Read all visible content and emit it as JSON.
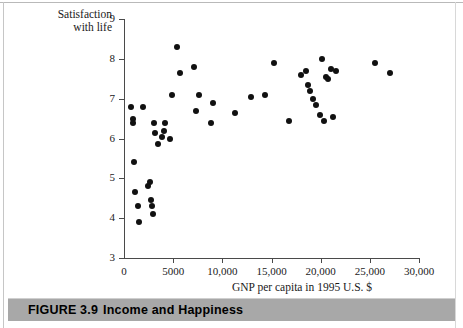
{
  "figure": {
    "caption_number": "FIGURE 3.9",
    "caption_title": "Income and Happiness"
  },
  "chart_data": {
    "type": "scatter",
    "title": "",
    "xlabel": "GNP per capita in 1995 U.S. $",
    "ylabel": "Satisfaction with life",
    "ylabel_line1": "Satisfaction",
    "ylabel_line2": "with life",
    "xlim": [
      0,
      30000
    ],
    "ylim": [
      3,
      9
    ],
    "xticks": [
      0,
      5000,
      10000,
      15000,
      20000,
      25000,
      30000
    ],
    "xtick_labels": [
      "0",
      "5000",
      "10,000",
      "15,000",
      "20,000",
      "25,000",
      "30,000"
    ],
    "yticks": [
      3,
      4,
      5,
      6,
      7,
      8,
      9
    ],
    "ytick_labels": [
      "3",
      "4",
      "5",
      "6",
      "7",
      "8",
      "9"
    ],
    "grid": false,
    "legend": false,
    "marker": "filled-circle",
    "marker_color": "#111111",
    "points": [
      {
        "x": 700,
        "y": 6.8
      },
      {
        "x": 900,
        "y": 6.5
      },
      {
        "x": 950,
        "y": 6.4
      },
      {
        "x": 1000,
        "y": 5.4
      },
      {
        "x": 1150,
        "y": 4.65
      },
      {
        "x": 1400,
        "y": 4.3
      },
      {
        "x": 1500,
        "y": 3.9
      },
      {
        "x": 1900,
        "y": 6.8
      },
      {
        "x": 2400,
        "y": 4.8
      },
      {
        "x": 2600,
        "y": 4.9
      },
      {
        "x": 2750,
        "y": 4.45
      },
      {
        "x": 2800,
        "y": 4.3
      },
      {
        "x": 2900,
        "y": 4.1
      },
      {
        "x": 3100,
        "y": 6.4
      },
      {
        "x": 3200,
        "y": 6.15
      },
      {
        "x": 3500,
        "y": 5.85
      },
      {
        "x": 3900,
        "y": 6.05
      },
      {
        "x": 4100,
        "y": 6.2
      },
      {
        "x": 4200,
        "y": 6.4
      },
      {
        "x": 4700,
        "y": 6.0
      },
      {
        "x": 4900,
        "y": 7.1
      },
      {
        "x": 5400,
        "y": 8.3
      },
      {
        "x": 5700,
        "y": 7.65
      },
      {
        "x": 7100,
        "y": 7.8
      },
      {
        "x": 7300,
        "y": 6.7
      },
      {
        "x": 7600,
        "y": 7.1
      },
      {
        "x": 8800,
        "y": 6.4
      },
      {
        "x": 9000,
        "y": 6.9
      },
      {
        "x": 11300,
        "y": 6.65
      },
      {
        "x": 12900,
        "y": 7.05
      },
      {
        "x": 14300,
        "y": 7.1
      },
      {
        "x": 15300,
        "y": 7.9
      },
      {
        "x": 16800,
        "y": 6.45
      },
      {
        "x": 18000,
        "y": 7.6
      },
      {
        "x": 18500,
        "y": 7.7
      },
      {
        "x": 18700,
        "y": 7.35
      },
      {
        "x": 18900,
        "y": 7.2
      },
      {
        "x": 19200,
        "y": 7.0
      },
      {
        "x": 19500,
        "y": 6.85
      },
      {
        "x": 19900,
        "y": 6.6
      },
      {
        "x": 20100,
        "y": 8.0
      },
      {
        "x": 20300,
        "y": 6.45
      },
      {
        "x": 20500,
        "y": 7.55
      },
      {
        "x": 20700,
        "y": 7.5
      },
      {
        "x": 21000,
        "y": 7.75
      },
      {
        "x": 21300,
        "y": 6.55
      },
      {
        "x": 21600,
        "y": 7.7
      },
      {
        "x": 25500,
        "y": 7.9
      },
      {
        "x": 27000,
        "y": 7.65
      }
    ]
  }
}
